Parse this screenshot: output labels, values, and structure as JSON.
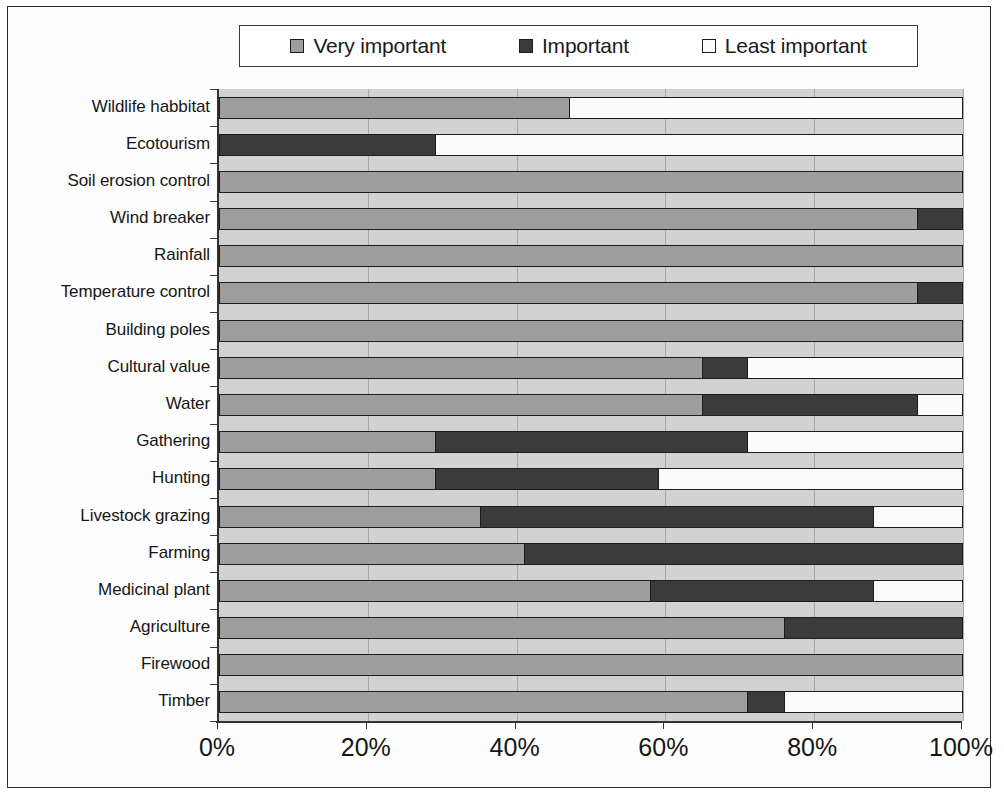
{
  "legend": {
    "position": "top",
    "items": [
      {
        "label": "Very important",
        "color": "#9e9e9e",
        "key": "very"
      },
      {
        "label": "Important",
        "color": "#3b3b3b",
        "key": "important"
      },
      {
        "label": "Least important",
        "color": "#fbfbfb",
        "key": "least"
      }
    ]
  },
  "axis": {
    "x_ticks": [
      "0%",
      "20%",
      "40%",
      "60%",
      "80%",
      "100%"
    ],
    "x_values": [
      0,
      20,
      40,
      60,
      80,
      100
    ]
  },
  "chart_data": {
    "type": "bar",
    "title": "",
    "subtitle": "",
    "xlabel": "",
    "ylabel": "",
    "orientation": "horizontal",
    "stacked": true,
    "stack_total": 100,
    "xlim": [
      0,
      100
    ],
    "grid": true,
    "legend_position": "top",
    "tick_labels": [
      "0%",
      "20%",
      "40%",
      "60%",
      "80%",
      "100%"
    ],
    "categories": [
      "Wildlife habbitat",
      "Ecotourism",
      "Soil erosion control",
      "Wind breaker",
      "Rainfall",
      "Temperature control",
      "Building poles",
      "Cultural value",
      "Water",
      "Gathering",
      "Hunting",
      "Livestock grazing",
      "Farming",
      "Medicinal plant",
      "Agriculture",
      "Firewood",
      "Timber"
    ],
    "series": [
      {
        "name": "Very important",
        "color": "#9e9e9e",
        "values": [
          47,
          0,
          100,
          94,
          100,
          94,
          100,
          65,
          65,
          29,
          29,
          35,
          41,
          58,
          76,
          100,
          71
        ]
      },
      {
        "name": "Important",
        "color": "#3b3b3b",
        "values": [
          0,
          29,
          0,
          6,
          0,
          6,
          0,
          6,
          29,
          42,
          30,
          53,
          59,
          30,
          24,
          0,
          5
        ]
      },
      {
        "name": "Least important",
        "color": "#fbfbfb",
        "values": [
          53,
          71,
          0,
          0,
          0,
          0,
          0,
          29,
          6,
          29,
          41,
          12,
          0,
          12,
          0,
          0,
          24
        ]
      }
    ]
  }
}
